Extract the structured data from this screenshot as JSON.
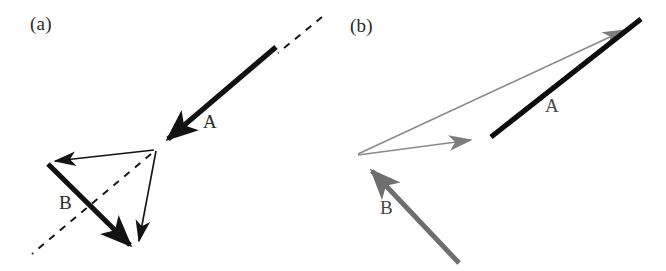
{
  "figure": {
    "background": "#ffffff",
    "width": 666,
    "height": 271,
    "panels": [
      {
        "id": "a",
        "label": "(a)",
        "label_pos": [
          30,
          14
        ],
        "vectors": [
          {
            "name": "A",
            "label": "A",
            "label_pos": [
              203,
              112
            ],
            "color": "#121212",
            "style": "thick-solid",
            "width": 5.2,
            "from": [
              276,
              47
            ],
            "to": [
              155,
              150
            ],
            "arrow": "end"
          },
          {
            "name": "B",
            "label": "B",
            "label_pos": [
              59,
              193
            ],
            "color": "#121212",
            "style": "thick-solid",
            "width": 5.2,
            "from": [
              48,
              164
            ],
            "to": [
              139,
              254
            ],
            "arrow": "end"
          },
          {
            "name": "resultant-left",
            "label": "",
            "color": "#121212",
            "style": "thin-solid",
            "width": 1.6,
            "from": [
              154,
              150
            ],
            "to": [
              46,
              162
            ],
            "arrow": "end"
          },
          {
            "name": "resultant-down",
            "label": "",
            "color": "#121212",
            "style": "thin-solid",
            "width": 1.6,
            "from": [
              156,
              151
            ],
            "to": [
              137,
              251
            ],
            "arrow": "end"
          }
        ],
        "dashed_lines": [
          {
            "name": "extension-line",
            "color": "#171717",
            "width": 2.0,
            "from": [
              322,
              17
            ],
            "to": [
              32,
              254
            ],
            "dash": "7,7",
            "gaps": [
              [
                276,
                47
              ],
              [
                155,
                150
              ]
            ]
          }
        ]
      },
      {
        "id": "b",
        "label": "(b)",
        "label_pos": [
          350,
          16
        ],
        "vectors": [
          {
            "name": "A",
            "label": "A",
            "label_pos": [
              545,
              96
            ],
            "color": "#0d0d0d",
            "style": "thick-solid",
            "width": 5.2,
            "from": [
              491,
              137
            ],
            "to": [
              641,
              19
            ],
            "arrow": "none"
          },
          {
            "name": "B",
            "label": "B",
            "label_pos": [
              380,
              198
            ],
            "color": "#6e6e6e",
            "style": "thick-solid",
            "width": 5.0,
            "from": [
              459,
              263
            ],
            "to": [
              359,
              157
            ],
            "arrow": "end"
          },
          {
            "name": "component-right",
            "label": "",
            "color": "#7a7a7a",
            "style": "thin-solid",
            "width": 1.7,
            "from": [
              358,
              155
            ],
            "to": [
              492,
              137
            ],
            "arrow": "end"
          },
          {
            "name": "resultant-diagonal",
            "label": "",
            "color": "#8a8a8a",
            "style": "thin-solid",
            "width": 1.7,
            "from": [
              358,
              154
            ],
            "to": [
              646,
              21
            ],
            "arrow": "end"
          }
        ],
        "dashed_lines": []
      }
    ],
    "colors": {
      "black": "#121212",
      "gray_thick": "#6e6e6e",
      "gray_thin": "#8a8a8a",
      "label_text": "#2a2a2a"
    }
  }
}
